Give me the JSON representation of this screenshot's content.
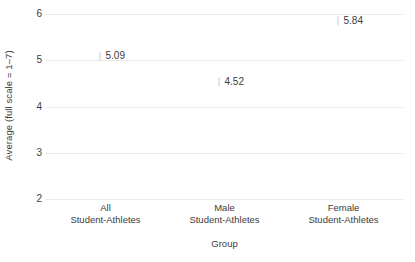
{
  "chart_data": {
    "type": "scatter",
    "title": "",
    "xlabel": "Group",
    "ylabel": "Average (full scale = 1–7)",
    "categories": [
      "All\nStudent-Athletes",
      "Male\nStudent-Athletes",
      "Female\nStudent-Athletes"
    ],
    "category_lines": [
      {
        "line1": "All",
        "line2": "Student-Athletes"
      },
      {
        "line1": "Male",
        "line2": "Student-Athletes"
      },
      {
        "line1": "Female",
        "line2": "Student-Athletes"
      }
    ],
    "values": [
      5.09,
      4.52,
      5.84
    ],
    "point_labels": [
      "5.09",
      "4.52",
      "5.84"
    ],
    "ylim": [
      2,
      6
    ],
    "yticks": [
      2,
      3,
      4,
      5,
      6
    ],
    "ytick_labels": [
      "2",
      "3",
      "4",
      "5",
      "6"
    ],
    "grid": true,
    "grid_axis": "y",
    "legend": "none"
  },
  "colors": {
    "background": "#ffffff",
    "text": "#3b3b3b",
    "gridline": "#e9e9e9",
    "marker": "#c9c9c9"
  }
}
